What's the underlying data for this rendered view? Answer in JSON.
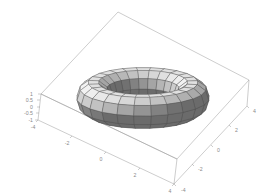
{
  "figure": {
    "title": "",
    "background_color": "#ffffff",
    "axis_color": "#9a9a9a",
    "tick_label_color": "#8a8a8a",
    "mesh_line_color": "#4a4a4a"
  },
  "chart_data": {
    "type": "surface",
    "surface": "torus",
    "title": "",
    "xlabel": "",
    "ylabel": "",
    "zlabel": "",
    "xlim": [
      -4,
      4
    ],
    "ylim": [
      -4,
      4
    ],
    "zlim": [
      -1,
      1
    ],
    "grid": true,
    "legend": "none",
    "projection": "3d-box-wireframe",
    "colormap": "grayscale",
    "parametric_equations": {
      "x": "(R + r*cos(v))*cos(u)",
      "y": "(R + r*cos(v))*sin(u)",
      "z": "r*sin(v)",
      "R": 3,
      "r": 1,
      "u_range": [
        0,
        6.283185307
      ],
      "v_range": [
        0,
        6.283185307
      ]
    },
    "mesh_resolution": {
      "u_segments": 24,
      "v_segments": 10
    },
    "x_ticks": [
      {
        "value": -4,
        "label": "-4"
      },
      {
        "value": -2,
        "label": "-2"
      },
      {
        "value": 0,
        "label": "0"
      },
      {
        "value": 2,
        "label": "2"
      },
      {
        "value": 4,
        "label": "4"
      }
    ],
    "y_ticks": [
      {
        "value": -4,
        "label": "-4"
      },
      {
        "value": -2,
        "label": "-2"
      },
      {
        "value": 0,
        "label": "0"
      },
      {
        "value": 2,
        "label": "2"
      },
      {
        "value": 4,
        "label": "4"
      }
    ],
    "z_ticks": [
      {
        "value": 1,
        "label": "1"
      },
      {
        "value": 0.5,
        "label": "0.5"
      },
      {
        "value": 0,
        "label": "0"
      },
      {
        "value": -0.5,
        "label": "-0.5"
      },
      {
        "value": -1,
        "label": "-1"
      }
    ]
  },
  "z_axis": {
    "tick_1": "1",
    "tick_05": "0.5",
    "tick_0": "0",
    "tick_m05": "-0.5",
    "tick_m1": "-1"
  },
  "x_axis": {
    "tick_m4": "-4",
    "tick_m2": "-2",
    "tick_0": "0",
    "tick_2": "2",
    "tick_4": "4"
  },
  "y_axis": {
    "tick_4": "4",
    "tick_2": "2",
    "tick_0": "0",
    "tick_m2": "-2",
    "tick_m4": "-4"
  }
}
